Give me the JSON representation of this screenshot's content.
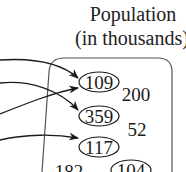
{
  "diagram": {
    "title_line1": "Population",
    "title_line2": "(in thousands)",
    "set_label": "Population (in thousands)",
    "circled_values": [
      {
        "id": "v109",
        "label": "109"
      },
      {
        "id": "v359",
        "label": "359"
      },
      {
        "id": "v117",
        "label": "117"
      },
      {
        "id": "v104",
        "label": "104"
      }
    ],
    "uncircled_values": [
      {
        "id": "v200",
        "label": "200"
      },
      {
        "id": "v52",
        "label": "52"
      },
      {
        "id": "v182",
        "label": "182"
      }
    ],
    "arrows": [
      {
        "from": "left-offscreen-1",
        "to": "109"
      },
      {
        "from": "left-offscreen-2",
        "to": "359"
      },
      {
        "from": "left-offscreen-3",
        "to": "109"
      },
      {
        "from": "left-offscreen-4",
        "to": "117"
      }
    ],
    "colors": {
      "stroke": "#1a1a1a",
      "box_stroke": "#555555",
      "background": "#ffffff"
    }
  }
}
